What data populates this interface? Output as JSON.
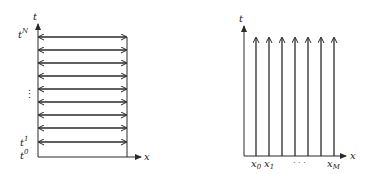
{
  "colors": {
    "stroke": "#2a2a2a",
    "background": "#ffffff"
  },
  "left_diagram": {
    "axis_t_label": "t",
    "axis_x_label": "x",
    "label_top": "t",
    "label_top_sup": "N",
    "label_ellipsis": "⋮",
    "label_1": "t",
    "label_1_sup": "1",
    "label_0": "t",
    "label_0_sup": "0",
    "rows": 9,
    "description": "horizontal double-headed arrows at each time level t^0..t^N"
  },
  "right_diagram": {
    "axis_t_label": "t",
    "axis_x_label": "x",
    "label_x0": "x",
    "label_x0_sub": "0",
    "label_x1": "x",
    "label_x1_sub": "1",
    "label_ellipsis": "· · ·",
    "label_xM": "x",
    "label_xM_sub": "M",
    "columns": 7,
    "description": "vertical upward arrows at each spatial node x_0..x_M"
  }
}
